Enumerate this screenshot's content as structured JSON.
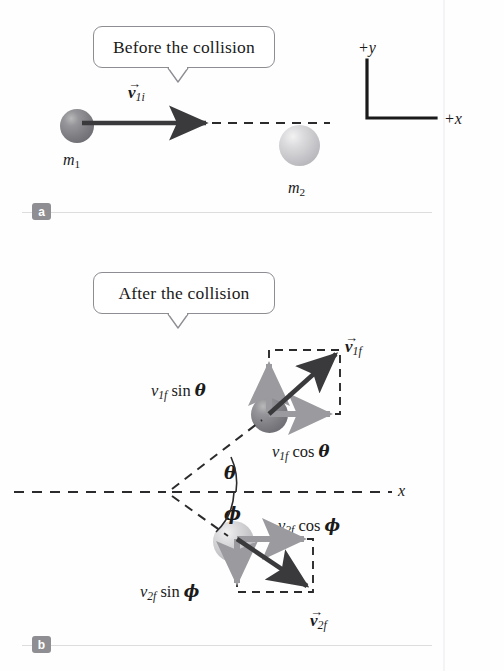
{
  "figure": {
    "title_a": "Before the collision",
    "title_b": "After the collision",
    "panel_a_letter": "a",
    "panel_b_letter": "b"
  },
  "colors": {
    "background": "#fefefe",
    "ink": "#1a1a1a",
    "vector_dark": "#3a3a3c",
    "vector_gray": "#9a9a9f",
    "dashed": "#2b2b2d",
    "callout_border": "#8d8d93",
    "badge": "#8e8e93",
    "rule": "#dddde0",
    "ball_dark": "#7d7d82",
    "ball_light": "#c4c4c8"
  },
  "panel_a": {
    "callout_label": "Before the collision",
    "mass1_label": "m",
    "mass1_sub": "1",
    "mass2_label": "m",
    "mass2_sub": "2",
    "velocity_label": "v",
    "velocity_sub": "1i",
    "axis_y_label": "+y",
    "axis_x_label": "+x"
  },
  "panel_b": {
    "callout_label": "After the collision",
    "v1f_label": "v",
    "v1f_sub": "1f",
    "v2f_label": "v",
    "v2f_sub": "2f",
    "v1f_sin_prefix": "v",
    "v1f_sin_sub": "1f",
    "v1f_sin_text": " sin ",
    "v1f_sin_angle": "θ",
    "v1f_cos_prefix": "v",
    "v1f_cos_sub": "1f",
    "v1f_cos_text": " cos ",
    "v1f_cos_angle": "θ",
    "v2f_cos_prefix": "v",
    "v2f_cos_sub": "2f",
    "v2f_cos_text": " cos ",
    "v2f_cos_angle": "ϕ",
    "v2f_sin_prefix": "v",
    "v2f_sin_sub": "2f",
    "v2f_sin_text": " sin ",
    "v2f_sin_angle": "ϕ",
    "theta_label": "θ",
    "phi_label": "ϕ",
    "axis_x_label": "x"
  }
}
